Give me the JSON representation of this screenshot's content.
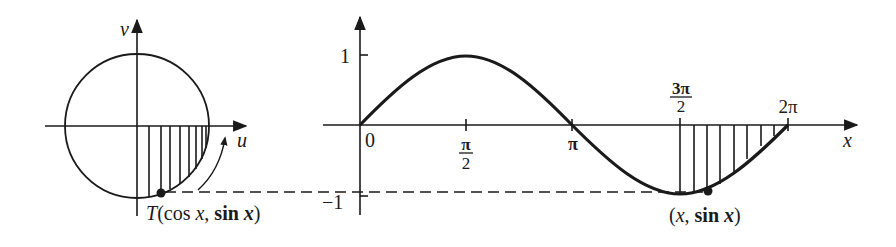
{
  "unit_circle": {
    "axis_u_label": "u",
    "axis_v_label": "v",
    "point_label_T": "T",
    "point_label_open": "(cos ",
    "point_label_x": "x",
    "point_label_comma": ", ",
    "point_label_sin": "sin ",
    "point_label_x2": "x",
    "point_label_close": ")"
  },
  "sine_graph": {
    "axis_x_label": "x",
    "y_tick_1": "1",
    "y_tick_neg1": "−1",
    "x_tick_0": "0",
    "x_tick_pi_over_2_num": "π",
    "x_tick_pi_over_2_den": "2",
    "x_tick_pi": "π",
    "x_tick_3pi_over_2_num": "3π",
    "x_tick_3pi_over_2_den": "2",
    "x_tick_2pi": "2π",
    "point_label_open": "(",
    "point_label_x": "x",
    "point_label_comma": ", ",
    "point_label_sin": "sin ",
    "point_label_x2": "x",
    "point_label_close": ")"
  },
  "colors": {
    "ink": "#1a1a1a",
    "background": "#ffffff"
  }
}
